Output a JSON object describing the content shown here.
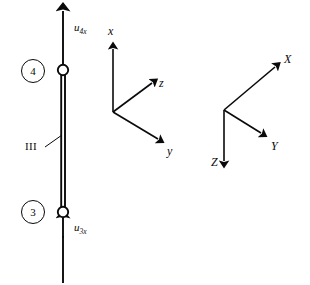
{
  "figure": {
    "stroke_color": "#0a0a0a",
    "background_color": "#ffffff"
  },
  "element": {
    "label": "III",
    "leader_from": {
      "x": 46,
      "y": 146
    },
    "leader_to": {
      "x": 62,
      "y": 136
    }
  },
  "nodes": [
    {
      "id": "node-4",
      "badge_label": "4",
      "badge_cx": 33,
      "badge_cy": 71,
      "hinge_cx": 63,
      "hinge_cy": 70
    },
    {
      "id": "node-3",
      "badge_label": "3",
      "badge_cx": 33,
      "badge_cy": 212,
      "hinge_cx": 63,
      "hinge_cy": 212
    }
  ],
  "displacements": [
    {
      "id": "u4x",
      "symbol": "u",
      "subscript": "4x",
      "label_x": 74,
      "label_y": 22,
      "direction": "up"
    },
    {
      "id": "u3x",
      "symbol": "u",
      "subscript": "3x",
      "label_x": 74,
      "label_y": 222,
      "direction": "up"
    }
  ],
  "local_axes": {
    "name": "local-coordinate-system",
    "origin": {
      "x": 113,
      "y": 112
    },
    "axes": [
      {
        "id": "x",
        "label": "x",
        "tip_x": 113,
        "tip_y": 40,
        "label_x": 108,
        "label_y": 25
      },
      {
        "id": "z",
        "label": "z",
        "tip_x": 157,
        "tip_y": 79,
        "label_x": 159,
        "label_y": 77
      },
      {
        "id": "y",
        "label": "y",
        "tip_x": 164,
        "tip_y": 143,
        "label_x": 167,
        "label_y": 145
      }
    ]
  },
  "global_axes": {
    "name": "global-coordinate-system",
    "origin": {
      "x": 224,
      "y": 110
    },
    "axes": [
      {
        "id": "X",
        "label": "X",
        "tip_x": 281,
        "tip_y": 62,
        "label_x": 284,
        "label_y": 53
      },
      {
        "id": "Y",
        "label": "Y",
        "tip_x": 267,
        "tip_y": 137,
        "label_x": 271,
        "label_y": 140
      },
      {
        "id": "Z",
        "label": "Z",
        "tip_x": 224,
        "tip_y": 170,
        "label_x": 211,
        "label_y": 156
      }
    ]
  }
}
